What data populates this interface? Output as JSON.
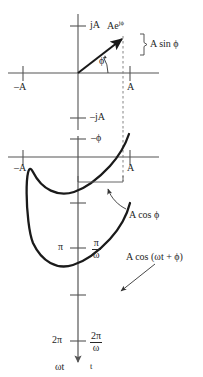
{
  "figure": {
    "ink_color": "#262626",
    "axis_color": "#555555",
    "dash_color": "#777777",
    "phasor_diagram": {
      "name": "complex-plane-phasor",
      "imag_axis_positive_label": "jA",
      "imag_axis_negative_label": "–jA",
      "real_axis_negative_label": "–A",
      "real_axis_positive_label": "A",
      "phasor_label_base": "Ae",
      "phasor_label_exponent": "jϕ",
      "angle_label": "ϕ",
      "projection_label": "A sin ϕ"
    },
    "waveform_diagram": {
      "name": "cosine-waveform",
      "phase_offset_label": "–ϕ",
      "real_axis_negative_label": "–A",
      "real_axis_positive_label": "A",
      "amplitude_brace_label": "A cos ϕ",
      "curve_label": "A cos (ωt + ϕ)",
      "tick_pi_left": "π",
      "tick_pi_right_num": "π",
      "tick_pi_right_den": "ω",
      "tick_2pi_left": "2π",
      "tick_2pi_right_num": "2π",
      "tick_2pi_right_den": "ω",
      "axis_label_left": "ωt",
      "axis_label_right": "t"
    }
  }
}
